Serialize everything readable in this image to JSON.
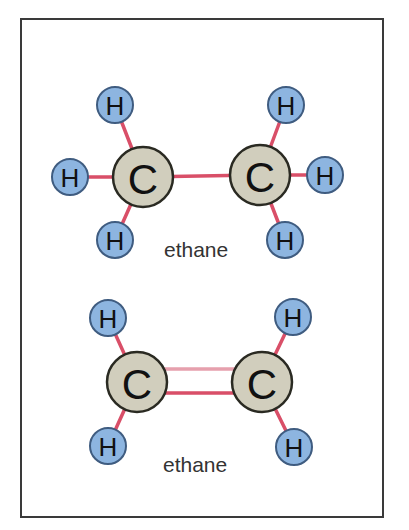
{
  "colors": {
    "hydrogen_fill": "#8db5e0",
    "hydrogen_stroke": "#3f5c80",
    "carbon_fill": "#d1cebd",
    "carbon_stroke": "#2a2a22",
    "bond": "#d94f68",
    "bond_light": "#e6a0ad",
    "frame": "#3a3a3a"
  },
  "molecules": [
    {
      "caption": "ethane",
      "bond_type": "single",
      "atoms": [
        {
          "element": "C",
          "label": "C",
          "x": 143,
          "y": 177
        },
        {
          "element": "C",
          "label": "C",
          "x": 260,
          "y": 175
        },
        {
          "element": "H",
          "label": "H",
          "x": 115,
          "y": 105
        },
        {
          "element": "H",
          "label": "H",
          "x": 70,
          "y": 177
        },
        {
          "element": "H",
          "label": "H",
          "x": 115,
          "y": 240
        },
        {
          "element": "H",
          "label": "H",
          "x": 286,
          "y": 105
        },
        {
          "element": "H",
          "label": "H",
          "x": 325,
          "y": 175
        },
        {
          "element": "H",
          "label": "H",
          "x": 285,
          "y": 240
        }
      ]
    },
    {
      "caption": "ethane",
      "bond_type": "double",
      "atoms": [
        {
          "element": "C",
          "label": "C",
          "x": 137,
          "y": 382
        },
        {
          "element": "C",
          "label": "C",
          "x": 262,
          "y": 382
        },
        {
          "element": "H",
          "label": "H",
          "x": 108,
          "y": 318
        },
        {
          "element": "H",
          "label": "H",
          "x": 108,
          "y": 446
        },
        {
          "element": "H",
          "label": "H",
          "x": 293,
          "y": 317
        },
        {
          "element": "H",
          "label": "H",
          "x": 294,
          "y": 447
        }
      ]
    }
  ]
}
